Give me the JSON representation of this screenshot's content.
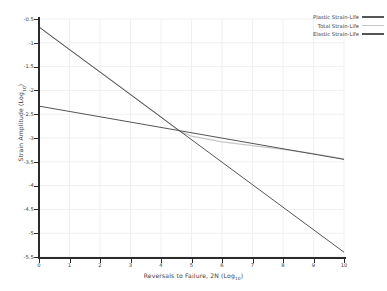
{
  "chart_data": {
    "type": "line",
    "title": "",
    "xlabel": "Reversals to Failure, 2N  (Log₁₀)",
    "ylabel": "Strain Amplitude  (Log₁₀)",
    "xlim": [
      0,
      10
    ],
    "ylim": [
      -5.5,
      -0.5
    ],
    "xticks": [
      0,
      1,
      2,
      3,
      4,
      5,
      6,
      7,
      8,
      9,
      10
    ],
    "xtick_labels": [
      "0",
      "1",
      "2",
      "3",
      "4",
      "5",
      "6",
      "7",
      "8",
      "9",
      "10"
    ],
    "yticks": [
      -0.5,
      -1,
      -1.5,
      -2,
      -2.5,
      -3,
      -3.5,
      -4,
      -4.5,
      -5,
      -5.5
    ],
    "ytick_labels": [
      "-0.5",
      "-1",
      "-1.5",
      "-2",
      "-2.5",
      "-3",
      "-3.5",
      "-4",
      "-4.5",
      "-5",
      "-5.5"
    ],
    "grid": true,
    "grid_color": "#f0f0f0",
    "legend_position": "upper right",
    "series": [
      {
        "name": "Plastic Strain-Life",
        "color": "#555555",
        "linewidth": 1.0,
        "x": [
          0,
          10
        ],
        "y": [
          -0.67,
          -5.4
        ],
        "slope": -0.473,
        "intercept": -0.67
      },
      {
        "name": "Total Strain-Life",
        "color": "#c8c8c8",
        "linewidth": 1.2,
        "x": [
          0,
          1,
          2,
          3,
          4,
          4.6,
          5,
          6,
          7,
          8,
          9,
          10
        ],
        "y": [
          -0.665,
          -1.14,
          -1.61,
          -2.08,
          -2.56,
          -2.85,
          -2.96,
          -3.08,
          -3.16,
          -3.24,
          -3.33,
          -3.44
        ],
        "note": "sum of elastic and plastic components"
      },
      {
        "name": "Elastic Strain-Life",
        "color": "#555555",
        "linewidth": 1.0,
        "x": [
          0,
          10
        ],
        "y": [
          -2.33,
          -3.45
        ],
        "slope": -0.112,
        "intercept": -2.33
      }
    ],
    "annotations": [
      {
        "label": "crossover of elastic and plastic lines",
        "x": 4.6,
        "y": -2.85
      }
    ]
  },
  "axes": {
    "spine_color": "#2b2b2b",
    "background": "#ffffff"
  }
}
